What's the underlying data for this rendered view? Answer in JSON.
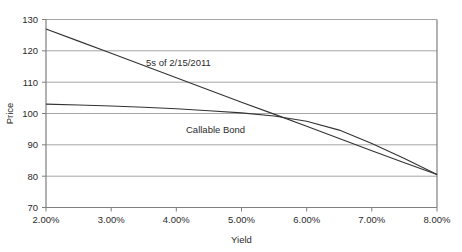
{
  "chart_data": {
    "type": "line",
    "title": "",
    "xlabel": "Yield",
    "ylabel": "Price",
    "xlim": [
      2.0,
      8.0
    ],
    "ylim": [
      70,
      130
    ],
    "grid": true,
    "grid_axis": "y",
    "legend": "inline-annotations",
    "xticks": [
      2.0,
      3.0,
      4.0,
      5.0,
      6.0,
      7.0,
      8.0
    ],
    "xtick_labels": [
      "2.00%",
      "3.00%",
      "4.00%",
      "5.00%",
      "6.00%",
      "7.00%",
      "8.00%"
    ],
    "yticks": [
      70,
      80,
      90,
      100,
      110,
      120,
      130
    ],
    "ytick_labels": [
      "70",
      "80",
      "90",
      "100",
      "110",
      "120",
      "130"
    ],
    "x": [
      2.0,
      2.5,
      3.0,
      3.5,
      4.0,
      4.5,
      5.0,
      5.5,
      6.0,
      6.5,
      7.0,
      7.5,
      8.0
    ],
    "series": [
      {
        "name": "5s of 2/15/2011",
        "label": "5s of 2/15/2011",
        "values": [
          127.0,
          123.1,
          119.2,
          115.3,
          111.4,
          107.5,
          103.6,
          99.8,
          95.9,
          92.0,
          88.1,
          84.3,
          80.5
        ]
      },
      {
        "name": "Callable Bond",
        "label": "Callable Bond",
        "values": [
          103.0,
          102.7,
          102.4,
          102.0,
          101.5,
          100.9,
          100.2,
          99.2,
          97.5,
          94.7,
          90.4,
          85.6,
          80.5
        ]
      }
    ],
    "annotations": [
      {
        "text": "5s of 2/15/2011",
        "x": 3.5,
        "y": 113.5
      },
      {
        "text": "Callable Bond",
        "x": 4.55,
        "y": 93.0
      }
    ],
    "colors": {
      "bullet_line": "#333333",
      "callable_line": "#333333",
      "gridline": "#a6a6a6",
      "axis": "#7f7f7f",
      "text": "#2b2b2b",
      "background": "#ffffff"
    }
  }
}
